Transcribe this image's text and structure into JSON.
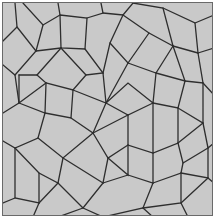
{
  "image": {
    "subject": "Penrose rhombus tiling",
    "fill_color": "#c9c9c9",
    "line_color": "#2e2e2e",
    "border_color": "#6a6a6a",
    "background": "#ffffff"
  }
}
